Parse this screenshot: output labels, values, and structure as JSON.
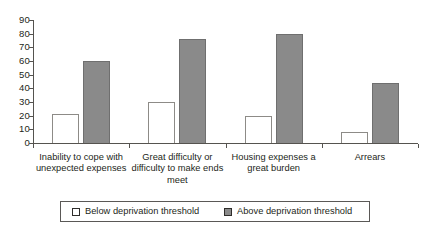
{
  "chart_data": {
    "type": "bar",
    "title": "",
    "subtitle": "",
    "xlabel": "",
    "ylabel": "",
    "ylim": [
      0,
      90
    ],
    "ytick_step": 10,
    "grid": false,
    "legend_position": "bottom",
    "categories": [
      "Inability to cope with unexpected expenses",
      "Great difficulty or difficulty to make ends meet",
      "Housing expenses a great burden",
      "Arrears"
    ],
    "ytick_labels": [
      "90",
      "80",
      "70",
      "60",
      "50",
      "40",
      "30",
      "20",
      "10",
      "0"
    ],
    "series": [
      {
        "name": "Below deprivation threshold",
        "color": "#ffffff",
        "values": [
          21,
          30,
          20,
          8
        ]
      },
      {
        "name": "Above deprivation threshold",
        "color": "#8a8a8a",
        "values": [
          60,
          76,
          80,
          44
        ]
      }
    ]
  },
  "legend": {
    "items": [
      {
        "label": "Below deprivation threshold"
      },
      {
        "label": "Above deprivation threshold"
      }
    ]
  },
  "colors": {
    "below_fill": "#ffffff",
    "above_fill": "#8a8a8a",
    "axis": "#55534f",
    "text": "#231f20"
  }
}
